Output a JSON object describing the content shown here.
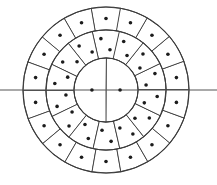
{
  "figure": {
    "background_color": "#ffffff",
    "line_color": "#3a3a3a",
    "diameter_line_color": "#555555",
    "dot_color": "#1c1c1c"
  },
  "geometry": {
    "center_x": 106,
    "center_y": 90,
    "outer_radius": 83,
    "middle_radius": 60,
    "inner_radius": 32,
    "dot_radius": 1.8,
    "diameter_line_y": 90,
    "diameter_line_x_start": 0,
    "diameter_line_x_end": 217
  },
  "rings": [
    {
      "name": "outer-ring",
      "cell_count": 18,
      "dots_per_cell": 1,
      "r_inner": 60,
      "r_outer": 83,
      "angle_offset_deg": 10,
      "dot_layout": "single-center"
    },
    {
      "name": "middle-ring",
      "cell_count": 14,
      "dots_per_cell": 2,
      "r_inner": 32,
      "r_outer": 60,
      "angle_offset_deg": 12.857142857142858,
      "dot_layout": "diagonal-pair"
    },
    {
      "name": "inner-circle",
      "cell_count": 2,
      "dots_per_cell": 1,
      "r_inner": 0,
      "r_outer": 32,
      "angle_offset_deg": 0,
      "dot_layout": "single-center"
    }
  ],
  "totals": {
    "outer_cells": 18,
    "middle_cells": 14,
    "inner_cells": 2,
    "total_cells": 34,
    "total_dots": 48
  }
}
